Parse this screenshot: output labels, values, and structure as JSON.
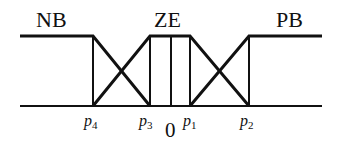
{
  "diagram": {
    "type": "fuzzy-membership-functions",
    "sets": [
      {
        "name": "NB",
        "label": "NB"
      },
      {
        "name": "ZE",
        "label": "ZE"
      },
      {
        "name": "PB",
        "label": "PB"
      }
    ],
    "axis": {
      "ticks": [
        {
          "var": "p",
          "sub": "4"
        },
        {
          "var": "p",
          "sub": "3"
        },
        {
          "var": "p",
          "sub": "1"
        },
        {
          "var": "p",
          "sub": "2"
        }
      ],
      "origin": "0"
    },
    "colors": {
      "line": "#111111",
      "background": "#ffffff"
    }
  }
}
